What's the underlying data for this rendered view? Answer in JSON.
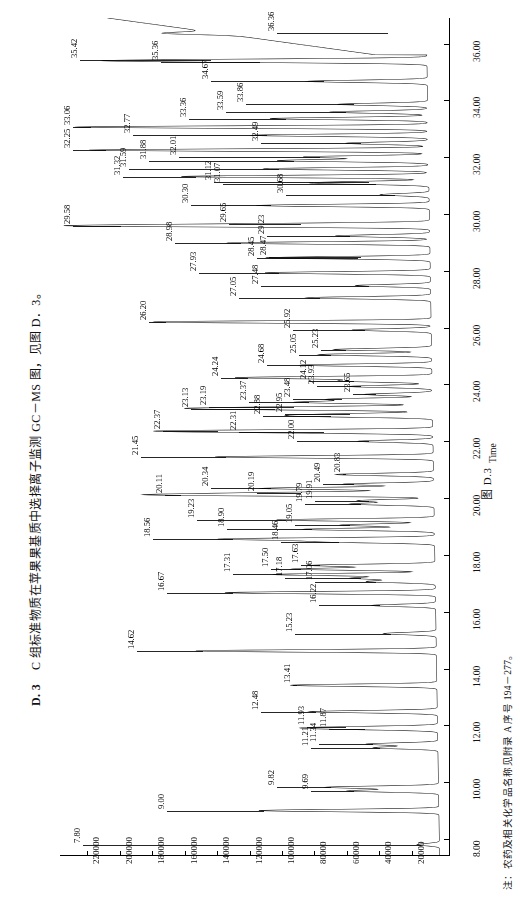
{
  "caption": {
    "number": "D. 3",
    "text": "C 组标准物质在苹果果基质中选择离子监测 GC－MS 图，见图 D．3。"
  },
  "figure_label": "图 D.3",
  "note": "注：农药及相关化学品名称见附录 A 序号 194－277。",
  "chart_data": {
    "type": "line",
    "title": "",
    "xlabel": "Time",
    "ylabel": "",
    "orientation": "rotated-90",
    "x_axis": {
      "label": "Time",
      "ticks": [
        "8.00",
        "10.00",
        "12.00",
        "14.00",
        "16.00",
        "18.00",
        "20.00",
        "22.00",
        "24.00",
        "26.00",
        "28.00",
        "30.00",
        "32.00",
        "34.00",
        "36.00"
      ],
      "min": 7.4,
      "max": 36.9
    },
    "y_axis": {
      "ticks": [
        "20000",
        "40000",
        "60000",
        "80000",
        "100000",
        "120000",
        "140000",
        "160000",
        "180000",
        "200000",
        "220000"
      ],
      "min": 0,
      "max": 232000
    },
    "peaks": [
      {
        "rt": "7.80",
        "height": 6
      },
      {
        "rt": "9.00",
        "height": 48
      },
      {
        "rt": "9.69",
        "height": 24
      },
      {
        "rt": "9.82",
        "height": 30
      },
      {
        "rt": "11.21",
        "height": 17
      },
      {
        "rt": "11.34",
        "height": 19
      },
      {
        "rt": "11.87",
        "height": 21
      },
      {
        "rt": "11.93",
        "height": 26
      },
      {
        "rt": "12.48",
        "height": 34
      },
      {
        "rt": "13.41",
        "height": 39
      },
      {
        "rt": "14.62",
        "height": 64
      },
      {
        "rt": "15.23",
        "height": 14
      },
      {
        "rt": "16.22",
        "height": 17
      },
      {
        "rt": "16.67",
        "height": 56
      },
      {
        "rt": "17.06",
        "height": 18
      },
      {
        "rt": "17.18",
        "height": 22
      },
      {
        "rt": "17.31",
        "height": 43
      },
      {
        "rt": "17.50",
        "height": 38
      },
      {
        "rt": "17.63",
        "height": 33
      },
      {
        "rt": "18.46",
        "height": 28
      },
      {
        "rt": "18.56",
        "height": 56
      },
      {
        "rt": "18.90",
        "height": 35
      },
      {
        "rt": "19.05",
        "height": 25
      },
      {
        "rt": "19.23",
        "height": 42
      },
      {
        "rt": "19.79",
        "height": 22
      },
      {
        "rt": "19.91",
        "height": 20
      },
      {
        "rt": "20.11",
        "height": 70
      },
      {
        "rt": "20.19",
        "height": 38
      },
      {
        "rt": "20.34",
        "height": 46
      },
      {
        "rt": "20.49",
        "height": 24
      },
      {
        "rt": "20.83",
        "height": 26
      },
      {
        "rt": "21.45",
        "height": 58
      },
      {
        "rt": "22.00",
        "height": 20
      },
      {
        "rt": "22.31",
        "height": 32
      },
      {
        "rt": "22.37",
        "height": 60
      },
      {
        "rt": "22.88",
        "height": 30
      },
      {
        "rt": "22.95",
        "height": 25
      },
      {
        "rt": "23.13",
        "height": 45
      },
      {
        "rt": "23.19",
        "height": 40
      },
      {
        "rt": "23.37",
        "height": 36
      },
      {
        "rt": "23.48",
        "height": 27
      },
      {
        "rt": "23.65",
        "height": 18
      },
      {
        "rt": "23.93",
        "height": 22
      },
      {
        "rt": "24.12",
        "height": 24
      },
      {
        "rt": "24.24",
        "height": 52
      },
      {
        "rt": "24.68",
        "height": 35
      },
      {
        "rt": "25.05",
        "height": 30
      },
      {
        "rt": "25.23",
        "height": 26
      },
      {
        "rt": "25.92",
        "height": 21
      },
      {
        "rt": "26.20",
        "height": 74
      },
      {
        "rt": "27.05",
        "height": 33
      },
      {
        "rt": "27.48",
        "height": 20
      },
      {
        "rt": "27.93",
        "height": 44
      },
      {
        "rt": "28.45",
        "height": 23
      },
      {
        "rt": "28.47",
        "height": 22
      },
      {
        "rt": "28.98",
        "height": 54
      },
      {
        "rt": "29.23",
        "height": 25
      },
      {
        "rt": "29.58",
        "height": 86
      },
      {
        "rt": "29.65",
        "height": 38
      },
      {
        "rt": "30.30",
        "height": 46
      },
      {
        "rt": "30.68",
        "height": 13
      },
      {
        "rt": "31.07",
        "height": 18
      },
      {
        "rt": "31.12",
        "height": 20
      },
      {
        "rt": "31.32",
        "height": 66
      },
      {
        "rt": "31.59",
        "height": 44
      },
      {
        "rt": "31.88",
        "height": 40
      },
      {
        "rt": "32.01",
        "height": 33
      },
      {
        "rt": "32.25",
        "height": 90
      },
      {
        "rt": "32.49",
        "height": 22
      },
      {
        "rt": "32.77",
        "height": 47
      },
      {
        "rt": "33.06",
        "height": 94
      },
      {
        "rt": "33.36",
        "height": 42
      },
      {
        "rt": "33.59",
        "height": 26
      },
      {
        "rt": "33.86",
        "height": 24
      },
      {
        "rt": "34.67",
        "height": 32
      },
      {
        "rt": "35.36",
        "height": 49
      },
      {
        "rt": "35.42",
        "height": 62
      },
      {
        "rt": "36.36",
        "height": 15
      }
    ]
  }
}
